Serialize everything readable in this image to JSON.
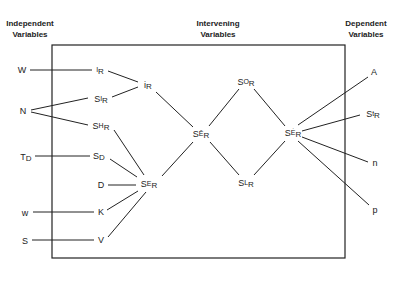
{
  "headers": {
    "independent": [
      "Independent",
      "Variables"
    ],
    "intervening": [
      "Intervening",
      "Variables"
    ],
    "dependent": [
      "Dependent",
      "Variables"
    ]
  },
  "independent_variables": [
    {
      "id": "W",
      "label": "W"
    },
    {
      "id": "N",
      "label": "N"
    },
    {
      "id": "TD",
      "label": "T",
      "sub": "D"
    },
    {
      "id": "w",
      "label": "w"
    },
    {
      "id": "S",
      "label": "S"
    }
  ],
  "intervening_variables": [
    {
      "id": "IR",
      "pre": "",
      "sup": "I",
      "sub": "R"
    },
    {
      "id": "SIR",
      "pre": "S",
      "sup": "I",
      "sub": "R"
    },
    {
      "id": "SHR",
      "pre": "S",
      "sup": "H",
      "sub": "R"
    },
    {
      "id": "SD",
      "pre": "S",
      "sup": "",
      "sub": "D"
    },
    {
      "id": "D",
      "pre": "D",
      "sup": "",
      "sub": ""
    },
    {
      "id": "K",
      "pre": "K",
      "sup": "",
      "sub": ""
    },
    {
      "id": "V",
      "pre": "V",
      "sup": "",
      "sub": ""
    },
    {
      "id": "iR",
      "pre": "i",
      "sup": "",
      "sub": "R"
    },
    {
      "id": "SER",
      "pre": "S",
      "sup": "E",
      "sub": "R"
    },
    {
      "id": "SER_bar",
      "pre": "S",
      "sup": "Ē",
      "sub": "R",
      "mark": "bar"
    },
    {
      "id": "SOR",
      "pre": "S",
      "sup": "O",
      "sub": "R"
    },
    {
      "id": "SLR",
      "pre": "S",
      "sup": "L",
      "sub": "R"
    },
    {
      "id": "SER_dot",
      "pre": "S",
      "sup": "Ė",
      "sub": "R",
      "mark": "dot"
    }
  ],
  "dependent_variables": [
    {
      "id": "A",
      "label": "A"
    },
    {
      "id": "StR",
      "pre": "S",
      "sup": "t",
      "sub": "R"
    },
    {
      "id": "n",
      "label": "n"
    },
    {
      "id": "p",
      "label": "p"
    }
  ],
  "edges": [
    [
      "W",
      "IR"
    ],
    [
      "N",
      "SIR"
    ],
    [
      "N",
      "SHR"
    ],
    [
      "TD",
      "SD"
    ],
    [
      "w",
      "K"
    ],
    [
      "S",
      "V"
    ],
    [
      "IR",
      "iR"
    ],
    [
      "SIR",
      "iR"
    ],
    [
      "iR",
      "SER_bar"
    ],
    [
      "SHR",
      "SER"
    ],
    [
      "SD",
      "SER"
    ],
    [
      "D",
      "SER"
    ],
    [
      "K",
      "SER"
    ],
    [
      "V",
      "SER"
    ],
    [
      "SER",
      "SER_bar"
    ],
    [
      "SER_bar",
      "SOR"
    ],
    [
      "SER_bar",
      "SLR"
    ],
    [
      "SOR",
      "SER_dot"
    ],
    [
      "SLR",
      "SER_dot"
    ],
    [
      "SER_dot",
      "A"
    ],
    [
      "SER_dot",
      "StR"
    ],
    [
      "SER_dot",
      "n"
    ],
    [
      "SER_dot",
      "p"
    ]
  ],
  "colors": {
    "line": "#222222",
    "background": "#ffffff"
  }
}
